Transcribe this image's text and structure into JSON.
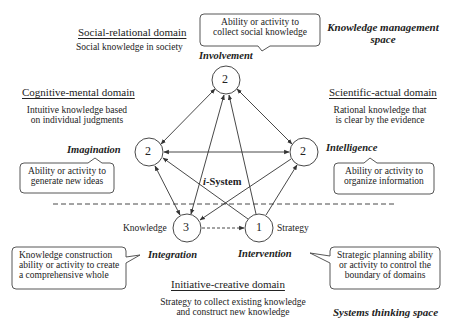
{
  "spaces": {
    "knowledge_management": "Knowledge management space",
    "knowledge_management_line1": "Knowledge management",
    "knowledge_management_line2": "space",
    "systems_thinking": "Systems thinking space"
  },
  "domains": {
    "social": {
      "title": "Social-relational domain",
      "desc": [
        "Social knowledge in society"
      ]
    },
    "cognitive": {
      "title": "Cognitive-mental domain",
      "desc": [
        "Intuitive knowledge based",
        "on individual judgments"
      ]
    },
    "scientific": {
      "title": "Scientific-actual domain",
      "desc": [
        "Rational knowledge that",
        "is clear by the evidence"
      ]
    },
    "initiative": {
      "title": "Initiative-creative domain",
      "desc": [
        "Strategy to collect existing knowledge",
        "and construct new knowledge"
      ]
    }
  },
  "center_label": "i-System",
  "center_label_prefix": "i",
  "center_label_suffix": "-System",
  "nodes": [
    {
      "id": "involvement",
      "role": "Involvement",
      "value": "2"
    },
    {
      "id": "imagination",
      "role": "Imagination",
      "value": "2"
    },
    {
      "id": "intelligence",
      "role": "Intelligence",
      "value": "2"
    },
    {
      "id": "integration",
      "role": "Integration",
      "value": "3",
      "side_label": "Knowledge"
    },
    {
      "id": "intervention",
      "role": "Intervention",
      "value": "1",
      "side_label": "Strategy"
    }
  ],
  "callouts": {
    "involvement": [
      "Ability or activity to",
      "collect social knowledge"
    ],
    "imagination": [
      "Ability or activity to",
      "generate new ideas"
    ],
    "intelligence": [
      "Ability or activity to",
      "organize information"
    ],
    "integration": [
      "Knowledge construction",
      "ability or activity to create",
      "a comprehensive whole"
    ],
    "intervention": [
      "Strategic planning ability",
      "or activity to control the",
      "boundary of domains"
    ]
  },
  "edges": [
    {
      "from": "involvement",
      "to": "imagination",
      "style": "solid",
      "arrows": "both"
    },
    {
      "from": "involvement",
      "to": "intelligence",
      "style": "solid",
      "arrows": "both"
    },
    {
      "from": "imagination",
      "to": "intelligence",
      "style": "solid",
      "arrows": "both"
    },
    {
      "from": "imagination",
      "to": "integration",
      "style": "solid",
      "arrows": "both"
    },
    {
      "from": "involvement",
      "to": "integration",
      "style": "solid",
      "arrows": "both"
    },
    {
      "from": "intervention",
      "to": "involvement",
      "style": "solid",
      "arrows": "end"
    },
    {
      "from": "intervention",
      "to": "imagination",
      "style": "solid",
      "arrows": "end"
    },
    {
      "from": "intervention",
      "to": "intelligence",
      "style": "solid",
      "arrows": "end"
    },
    {
      "from": "intelligence",
      "to": "integration",
      "style": "solid",
      "arrows": "end"
    },
    {
      "from": "integration",
      "to": "intervention",
      "style": "dashed",
      "arrows": "end"
    }
  ],
  "colors": {
    "line": "#333333",
    "text": "#222222",
    "background": "#ffffff"
  }
}
